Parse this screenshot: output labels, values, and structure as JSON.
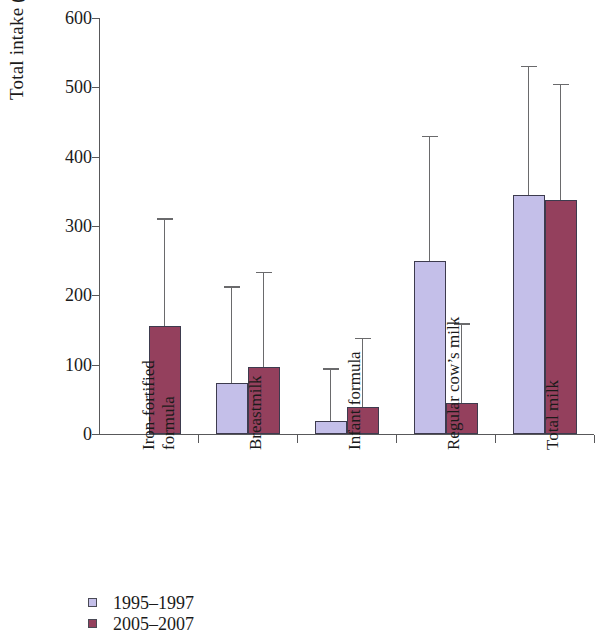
{
  "chart_data": {
    "type": "bar",
    "title": "",
    "xlabel": "",
    "ylabel": "Total intake (g)",
    "ylim": [
      0,
      600
    ],
    "yticks": [
      0,
      100,
      200,
      300,
      400,
      500,
      600
    ],
    "grid": false,
    "legend_position": "bottom-left",
    "categories": [
      "Iron-fortified\nformula",
      "Breastmilk",
      "Infant formula",
      "Regular cow's milk",
      "Total milk"
    ],
    "series": [
      {
        "name": "1995–1997",
        "color": "#c4bfe9",
        "values": [
          null,
          73,
          19,
          249,
          345
        ],
        "error_upper": [
          null,
          213,
          95,
          430,
          531
        ]
      },
      {
        "name": "2005–2007",
        "color": "#94405d",
        "values": [
          156,
          96,
          39,
          44,
          337
        ],
        "error_upper": [
          311,
          234,
          139,
          160,
          505
        ]
      }
    ]
  },
  "axis": {
    "y_label": "Total intake (g)",
    "y_ticks": [
      "600",
      "500",
      "400",
      "300",
      "200",
      "100",
      "0"
    ]
  },
  "legend": {
    "items": [
      {
        "label": "1995–1997",
        "color": "#c4bfe9"
      },
      {
        "label": "2005–2007",
        "color": "#94405d"
      }
    ]
  },
  "categories": [
    {
      "line1": "Iron-fortified",
      "line2": "formula"
    },
    {
      "line1": "Breastmilk",
      "line2": ""
    },
    {
      "line1": "Infant formula",
      "line2": ""
    },
    {
      "line1": "Regular cow’s milk",
      "line2": ""
    },
    {
      "line1": "Total milk",
      "line2": ""
    }
  ]
}
